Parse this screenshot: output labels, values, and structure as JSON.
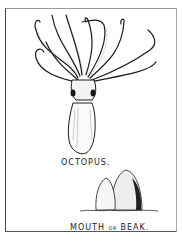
{
  "illustration": {
    "labels": {
      "octopus": "OCTOPUS.",
      "mouth": "MOUTH",
      "or": "OR",
      "beak": "BEAK."
    },
    "subjects": [
      "octopus",
      "mouth-or-beak"
    ],
    "colors": {
      "ink": "#1a1a1a",
      "paper": "#ffffff"
    }
  }
}
